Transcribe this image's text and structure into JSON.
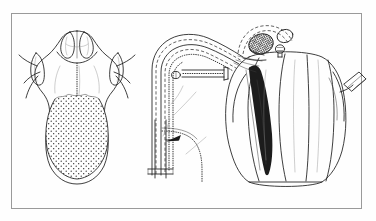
{
  "plate": {
    "background_color": "#fefefe",
    "ink_color": "#1c1c1c",
    "border_color": "#9a9a9a",
    "width": 376,
    "height": 221,
    "border_box": {
      "x": 11,
      "y": 13,
      "width": 351,
      "height": 196
    },
    "caption": "",
    "figure_label": ""
  },
  "panels": [
    {
      "id": "panel-left",
      "name": "dorsal-tongue-view",
      "label": "",
      "description": "Dorsal view of a broad spatulate tongue with paired anterior horns, lateral pointed lobes and a densely stippled posterior surface",
      "parts": [
        {
          "name": "anterior-horn-left",
          "label": "",
          "style": "outline"
        },
        {
          "name": "anterior-horn-right",
          "label": "",
          "style": "outline"
        },
        {
          "name": "median-notch",
          "label": "",
          "style": "outline"
        },
        {
          "name": "lateral-lobe-left",
          "label": "",
          "style": "outline"
        },
        {
          "name": "lateral-lobe-right",
          "label": "",
          "style": "outline"
        },
        {
          "name": "stippled-pad",
          "label": "",
          "style": "stipple"
        },
        {
          "name": "median-groove",
          "label": "",
          "style": "dotted"
        }
      ]
    },
    {
      "id": "panel-middle",
      "name": "duct-tract-diagram",
      "label": "",
      "description": "Schematic looped tract drawn with paired dashed and dotted lines, a recurving limb and a short straight cut stem with an arrow marker",
      "parts": [
        {
          "name": "outer-tract-wall",
          "label": "",
          "style": "outline"
        },
        {
          "name": "inner-dashed-channel",
          "label": "",
          "style": "dashed"
        },
        {
          "name": "dotted-lumen-line",
          "label": "",
          "style": "dotted"
        },
        {
          "name": "recurrent-limb",
          "label": "",
          "style": "dotted"
        },
        {
          "name": "cut-stem",
          "label": "",
          "style": "outline"
        },
        {
          "name": "pointer-arrow",
          "label": "",
          "style": "filled"
        },
        {
          "name": "leader-line",
          "label": "",
          "style": "faint"
        }
      ]
    },
    {
      "id": "panel-right",
      "name": "lobed-organ-view",
      "label": "",
      "description": "Large multi-lobed bulbous organ with four rounded longitudinal lobes, a hatched oval body and small open circle at the apex, a dark elongate internal strand and a short cut tube on the right flank",
      "parts": [
        {
          "name": "lobe-one",
          "label": "",
          "style": "outline"
        },
        {
          "name": "lobe-two",
          "label": "",
          "style": "outline"
        },
        {
          "name": "lobe-three",
          "label": "",
          "style": "outline"
        },
        {
          "name": "lobe-four",
          "label": "",
          "style": "outline"
        },
        {
          "name": "apical-hatched-body",
          "label": "",
          "style": "crosshatch"
        },
        {
          "name": "apical-open-vesicle",
          "label": "",
          "style": "outline"
        },
        {
          "name": "apical-nodule",
          "label": "",
          "style": "outline"
        },
        {
          "name": "dark-internal-strand",
          "label": "",
          "style": "filled"
        },
        {
          "name": "lateral-cut-tube",
          "label": "",
          "style": "outline"
        },
        {
          "name": "dashed-capsule-edge",
          "label": "",
          "style": "dashed"
        }
      ]
    }
  ]
}
